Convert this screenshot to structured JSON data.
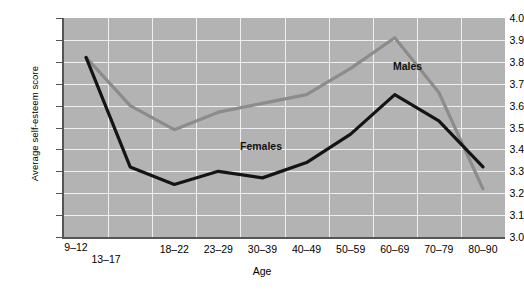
{
  "chart_data": {
    "type": "line",
    "title": "",
    "xlabel": "Age",
    "ylabel": "Average self-esteem score",
    "categories": [
      "9–12",
      "13–17",
      "18–22",
      "23–29",
      "30–39",
      "40–49",
      "50–59",
      "60–69",
      "70–79",
      "80–90"
    ],
    "yticks": [
      "3.0",
      "3.1",
      "3.2",
      "3.3",
      "3.4",
      "3.5",
      "3.6",
      "3.7",
      "3.8",
      "3.9",
      "4.0"
    ],
    "ylim": [
      3.0,
      4.0
    ],
    "grid": true,
    "legend_position": "inline-annotation",
    "series": [
      {
        "name": "Males",
        "color": "#8c8c8c",
        "values": [
          3.82,
          3.6,
          3.49,
          3.57,
          3.61,
          3.65,
          3.77,
          3.91,
          3.66,
          3.22
        ]
      },
      {
        "name": "Females",
        "color": "#141414",
        "values": [
          3.82,
          3.32,
          3.24,
          3.3,
          3.27,
          3.34,
          3.47,
          3.65,
          3.53,
          3.32
        ]
      }
    ],
    "annotations": [
      {
        "text": "Males",
        "series": "Males",
        "x_px": 393,
        "y_px": 60
      },
      {
        "text": "Females",
        "series": "Females",
        "x_px": 240,
        "y_px": 140
      }
    ],
    "plot_bg": "#b3b3b3",
    "grid_color": "#efefef",
    "axis_color": "#555555"
  }
}
